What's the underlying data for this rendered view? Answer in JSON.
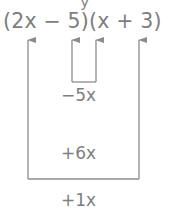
{
  "diagram": {
    "type": "foil-middle-terms",
    "top_fragment": "y",
    "expression": "(2x − 5)(x + 3)",
    "factors": [
      {
        "label": "2x",
        "role": "outer-first"
      },
      {
        "label": "−5",
        "role": "inner-first"
      },
      {
        "label": "x",
        "role": "inner-second"
      },
      {
        "label": "3",
        "role": "outer-second"
      }
    ],
    "inner_product": "−5x",
    "outer_product": "+6x",
    "sum": "+1x",
    "colors": {
      "text": "#7d7d7d",
      "lines": "#8c8c8c",
      "background": "#ffffff"
    }
  }
}
